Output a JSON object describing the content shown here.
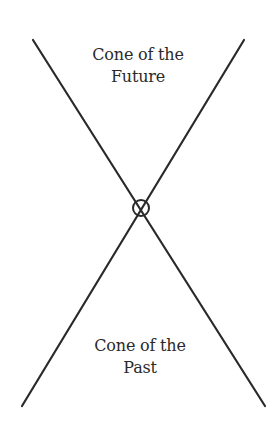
{
  "diagram": {
    "top_label": {
      "line1": "Cone of the",
      "line2": "Future"
    },
    "bottom_label": {
      "line1": "Cone of the",
      "line2": "Past"
    },
    "center_symbol": "circled-cross-event",
    "colors": {
      "line": "#2a2a2a",
      "text": "#2a2a2a",
      "background": "#ffffff"
    }
  }
}
